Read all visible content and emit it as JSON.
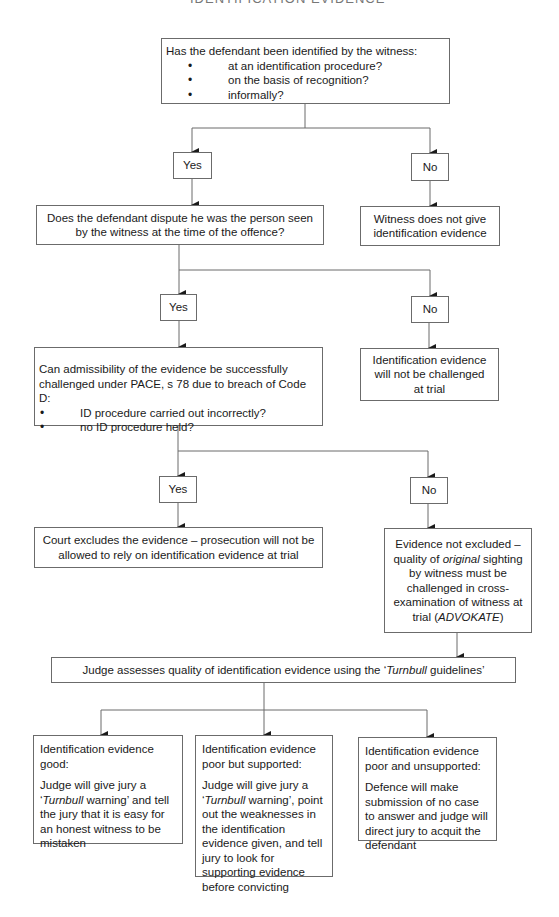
{
  "heading_cut": "IDENTIFICATION EVIDENCE",
  "q1": {
    "title": "Has the defendant been identified by the witness:",
    "bullets": [
      "at an identification procedure?",
      "on the basis of recognition?",
      "informally?"
    ]
  },
  "branch1": {
    "yes": "Yes",
    "no": "No"
  },
  "q2": {
    "text": "Does the defendant dispute he was the person seen by the witness at the time of the offence?"
  },
  "no1_result": {
    "text": "Witness does not give identification evidence"
  },
  "branch2": {
    "yes": "Yes",
    "no": "No"
  },
  "q3": {
    "title": "Can admissibility of the evidence be successfully challenged under PACE, s 78 due to breach of Code D:",
    "bullets": [
      "ID procedure carried out incorrectly?",
      "no ID procedure held?"
    ]
  },
  "no2_result": {
    "text": "Identification evidence will not be challenged at trial"
  },
  "branch3": {
    "yes": "Yes",
    "no": "No"
  },
  "yes3_result": {
    "text": "Court excludes the evidence – prosecution will not be allowed to rely on identification evidence at trial"
  },
  "no3_result": {
    "before": "Evidence not excluded – quality of ",
    "italic": "original",
    "after": " sighting by witness must be challenged in cross-examination of witness at trial (",
    "case": "ADVOKATE",
    "end": ")"
  },
  "judge": {
    "before": "Judge assesses quality of identification evidence using the ‘",
    "italic": "Turnbull",
    "after": " guidelines’"
  },
  "outcomes": [
    {
      "title": "Identification evidence good:",
      "body_before": "Judge will give jury a ‘",
      "body_italic": "Turnbull",
      "body_after": " warning’ and tell the jury that it is easy for an honest witness to be mistaken"
    },
    {
      "title": "Identification evidence poor but supported:",
      "body_before": "Judge will give jury a ‘",
      "body_italic": "Turnbull",
      "body_after": " warning’, point out the weaknesses in the identification evidence given, and tell jury to look for supporting evidence before convicting"
    },
    {
      "title": "Identification evidence poor and unsupported:",
      "body_before": "Defence will make submission of no case to answer and judge will direct jury to acquit the defendant",
      "body_italic": "",
      "body_after": ""
    }
  ],
  "colors": {
    "line": "#6b6b6b",
    "text": "#1a1a1a",
    "background": "#ffffff"
  }
}
